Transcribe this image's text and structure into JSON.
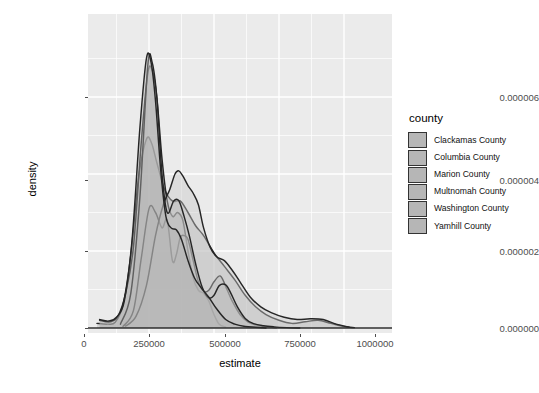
{
  "chart_data": {
    "type": "area",
    "title": "",
    "subtitle": "",
    "xlabel": "estimate",
    "ylabel": "density",
    "legend_title": "county",
    "legend_position": "right",
    "grid": true,
    "xlim": [
      -50000,
      1060000
    ],
    "ylim": [
      0,
      6.9e-06
    ],
    "xticks": [
      0,
      250000,
      500000,
      750000,
      1000000
    ],
    "xtick_labels": [
      "0",
      "250000",
      "500000",
      "750000",
      "1000000"
    ],
    "yticks": [
      0,
      2e-06,
      4e-06,
      6e-06
    ],
    "ytick_labels": [
      "0.000000",
      "0.000002",
      "0.000004",
      "0.000006"
    ],
    "panel_background": "#ebebeb",
    "gridline_color": "#ffffff",
    "fill_color": "#b6b6b6",
    "line_color": "#262626",
    "series": [
      {
        "name": "Clackamas County",
        "fill": "#b6b6b6",
        "x": [
          50000,
          90000,
          120000,
          150000,
          180000,
          210000,
          240000,
          260000,
          280000,
          310000,
          340000,
          370000,
          400000,
          430000,
          460000,
          500000,
          540000,
          580000,
          620000,
          660000,
          700000,
          750000,
          800000,
          850000,
          900000,
          950000,
          1000000,
          1040000
        ],
        "y": [
          1.2e-07,
          1e-07,
          1.5e-07,
          6e-07,
          1.9e-06,
          3.9e-06,
          4.9e-06,
          4.8e-06,
          4.3e-06,
          3.6e-06,
          3.3e-06,
          3.3e-06,
          3e-06,
          2.65e-06,
          2.4e-06,
          1.95e-06,
          1.6e-06,
          1.25e-06,
          8.5e-07,
          5.5e-07,
          3.5e-07,
          2e-07,
          1.2e-07,
          1.6e-07,
          2e-07,
          1.2e-07,
          4e-08,
          1e-08
        ]
      },
      {
        "name": "Columbia County",
        "fill": "#b6b6b6",
        "x": [
          60000,
          100000,
          130000,
          160000,
          190000,
          220000,
          245000,
          262000,
          280000,
          300000,
          320000,
          340000,
          360000,
          380000,
          400000,
          420000,
          440000,
          460000,
          480000,
          500000,
          520000,
          545000
        ],
        "y": [
          2e-07,
          1.6e-07,
          3e-07,
          9e-07,
          2.1e-06,
          4.8e-06,
          6.6e-06,
          6.7e-06,
          6e-06,
          4.4e-06,
          3.3e-06,
          2.9e-06,
          3e-06,
          2.8e-06,
          2e-06,
          1.3e-06,
          9.8e-07,
          9e-07,
          7e-07,
          3.5e-07,
          1e-07,
          2e-08
        ]
      },
      {
        "name": "Marion County",
        "fill": "#b6b6b6",
        "x": [
          150000,
          190000,
          220000,
          250000,
          275000,
          300000,
          320000,
          340000,
          355000,
          370000,
          385000,
          400000,
          420000,
          440000,
          460000,
          480000,
          500000,
          525000,
          550000,
          570000,
          600000,
          630000,
          660000,
          700000,
          740000
        ],
        "y": [
          4e-08,
          4.5e-07,
          1.8e-06,
          3.1e-06,
          3e-06,
          2.6e-06,
          2.8e-06,
          1.75e-06,
          1.9e-06,
          2.35e-06,
          2.4e-06,
          2.3e-06,
          1.75e-06,
          1.2e-06,
          9.5e-07,
          9.8e-07,
          1.2e-06,
          1.35e-06,
          1e-06,
          7e-07,
          3.5e-07,
          1.6e-07,
          8e-08,
          3e-08,
          1e-08
        ]
      },
      {
        "name": "Multnomah County",
        "fill": "#c8c8c8",
        "x": [
          160000,
          200000,
          240000,
          275000,
          305000,
          330000,
          350000,
          365000,
          380000,
          400000,
          420000,
          440000,
          460000,
          485000,
          510000,
          540000,
          570000,
          600000,
          640000,
          680000,
          720000,
          770000,
          820000,
          870000,
          920000,
          970000,
          1020000
        ],
        "y": [
          5e-08,
          3e-07,
          1.1e-06,
          2.4e-06,
          3.2e-06,
          3.6e-06,
          4e-06,
          4.08e-06,
          3.95e-06,
          3.7e-06,
          3.5e-06,
          3.2e-06,
          2.6e-06,
          2.1e-06,
          1.85e-06,
          1.75e-06,
          1.5e-06,
          1.2e-06,
          8e-07,
          5.5e-07,
          4e-07,
          2.8e-07,
          2.2e-07,
          2.4e-07,
          2.2e-07,
          1e-07,
          2e-08
        ]
      },
      {
        "name": "Washington County",
        "fill": "#bdbdbd",
        "x": [
          140000,
          180000,
          215000,
          245000,
          262000,
          280000,
          300000,
          320000,
          345000,
          365000,
          385000,
          405000,
          430000,
          455000,
          480000,
          500000,
          520000,
          545000,
          565000,
          590000,
          620000,
          650000,
          690000,
          730000,
          780000,
          830000
        ],
        "y": [
          1e-07,
          9e-07,
          3.4e-06,
          6.8e-06,
          6.9e-06,
          6e-06,
          4e-06,
          3e-06,
          3.3e-06,
          3.3e-06,
          2.9e-06,
          2.4e-06,
          1.65e-06,
          1.05e-06,
          7.8e-07,
          8.5e-07,
          1.1e-06,
          1.12e-06,
          9e-07,
          5.5e-07,
          2.5e-07,
          1.2e-07,
          6e-08,
          3e-08,
          1e-08,
          0.0
        ]
      },
      {
        "name": "Yamhill County",
        "fill": "#b0b0b0",
        "x": [
          60000,
          95000,
          125000,
          155000,
          185000,
          215000,
          240000,
          258000,
          275000,
          295000,
          315000,
          335000,
          355000,
          375000,
          400000,
          425000,
          450000,
          480000,
          510000,
          545000,
          580000,
          620000,
          660000,
          700000
        ],
        "y": [
          2.2e-07,
          1.8e-07,
          2.8e-07,
          7e-07,
          2.3e-06,
          5.2e-06,
          7e-06,
          6.9e-06,
          5.9e-06,
          4.1e-06,
          2.9e-06,
          2.6e-06,
          2.55e-06,
          2.3e-06,
          1.75e-06,
          1.3e-06,
          1.05e-06,
          8e-07,
          5e-07,
          2.2e-07,
          1e-07,
          4e-08,
          2e-08,
          0.0
        ]
      }
    ]
  },
  "axes": {
    "x_title": "estimate",
    "y_title": "density",
    "x_tick_labels": [
      "0",
      "250000",
      "500000",
      "750000",
      "1000000"
    ],
    "y_tick_labels": [
      "0.000006",
      "0.000004",
      "0.000002",
      "0.000000"
    ]
  },
  "legend": {
    "title": "county",
    "items": [
      {
        "label": "Clackamas County"
      },
      {
        "label": "Columbia County"
      },
      {
        "label": "Marion County"
      },
      {
        "label": "Multnomah County"
      },
      {
        "label": "Washington County"
      },
      {
        "label": "Yamhill County"
      }
    ]
  }
}
